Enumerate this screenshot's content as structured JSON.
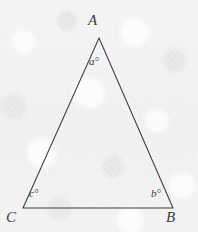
{
  "figure": {
    "name": "triangle-angle-diagram",
    "type": "geometry-diagram",
    "background_color": "#f3f3f3",
    "line_color": "#3c3c3c",
    "text_color": "#3a3a3a"
  },
  "triangle": {
    "vertices": [
      {
        "id": "A",
        "label": "A",
        "x": 99,
        "y": 38,
        "position": "apex"
      },
      {
        "id": "B",
        "label": "B",
        "x": 173,
        "y": 208,
        "position": "bottom-right"
      },
      {
        "id": "C",
        "label": "C",
        "x": 23,
        "y": 208,
        "position": "bottom-left"
      }
    ],
    "edges": [
      {
        "from": "C",
        "to": "A"
      },
      {
        "from": "A",
        "to": "B"
      },
      {
        "from": "B",
        "to": "C"
      }
    ]
  },
  "angles": [
    {
      "id": "a",
      "label": "a°",
      "at_vertex": "A",
      "x": 95,
      "y": 62
    },
    {
      "id": "b",
      "label": "b°",
      "at_vertex": "B",
      "x": 158,
      "y": 194
    },
    {
      "id": "c",
      "label": "c°",
      "at_vertex": "C",
      "x": 36,
      "y": 194
    }
  ]
}
